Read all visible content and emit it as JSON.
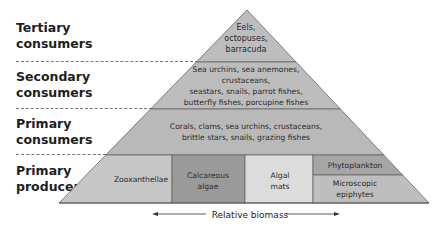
{
  "levels": [
    {
      "id": "tertiary",
      "label_line1": "Tertiary",
      "label_line2": "consumers",
      "organisms": [
        "Eels,",
        "octopuses,",
        "barracuda"
      ]
    },
    {
      "id": "secondary",
      "label_line1": "Secondary",
      "label_line2": "consumers",
      "organisms": [
        "Sea urchins, sea anemones,",
        "crustaceans,",
        "seastars, snails, parrot fishes,",
        "butterfly fishes, porcupine fishes"
      ]
    },
    {
      "id": "primary-consumers",
      "label_line1": "Primary",
      "label_line2": "consumers",
      "organisms": [
        "Corals, clams, sea urchins, crustaceans,",
        "brittle stars, snails, grazing fishes"
      ]
    },
    {
      "id": "primary-producers",
      "label_line1": "Primary",
      "label_line2": "producers",
      "cells": [
        {
          "id": "zooxanthellae",
          "lines": [
            "Zooxanthellae"
          ]
        },
        {
          "id": "calcareous-algae",
          "lines": [
            "Calcareous",
            "algae"
          ]
        },
        {
          "id": "algal-mats",
          "lines": [
            "Algal",
            "mats"
          ]
        },
        {
          "id": "phytoplankton",
          "lines": [
            "Phytoplankton"
          ]
        },
        {
          "id": "microscopic-epiphytes",
          "lines": [
            "Microscopic",
            "epiphytes"
          ]
        }
      ]
    }
  ],
  "axis": {
    "label": "Relative biomass"
  },
  "colors": {
    "tier_fill": "#bdbdbd",
    "zooxanthellae": "#c6c6c6",
    "calcareous": "#9a9a9a",
    "algal_mats": "#dcdcdc",
    "phytoplankton": "#a6a6a6",
    "epiphytes": "#bebebe",
    "outline": "#555555"
  }
}
